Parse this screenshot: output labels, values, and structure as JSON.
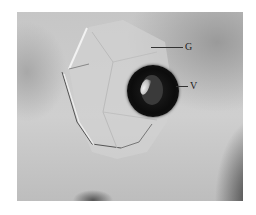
{
  "figure": {
    "labels": [
      {
        "id": "G",
        "text": "G"
      },
      {
        "id": "V",
        "text": "V"
      }
    ]
  }
}
